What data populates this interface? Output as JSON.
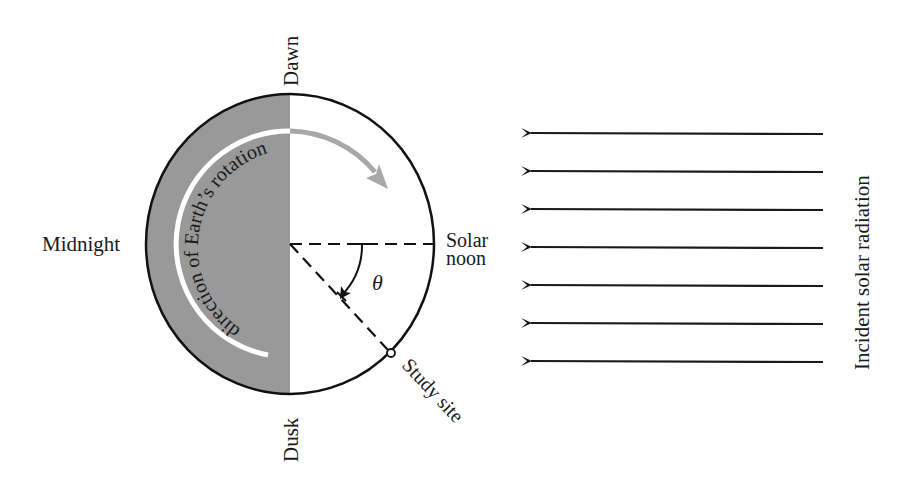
{
  "diagram": {
    "type": "earth-rotation-solar-geometry",
    "labels": {
      "dawn": "Dawn",
      "dusk": "Dusk",
      "midnight": "Midnight",
      "solar_noon_line1": "Solar",
      "solar_noon_line2": "noon",
      "study_site": "Study site",
      "theta": "θ",
      "rotation": "direction of Earth’s rotation",
      "radiation": "Incident solar radiation"
    },
    "radiation_arrows": {
      "count": 7,
      "direction": "left"
    },
    "colors": {
      "night_shade": "#999999",
      "outline": "#111111",
      "rotation_arc_night": "#ffffff",
      "rotation_arc_day": "#a8a8a8",
      "background": "#ffffff"
    }
  }
}
